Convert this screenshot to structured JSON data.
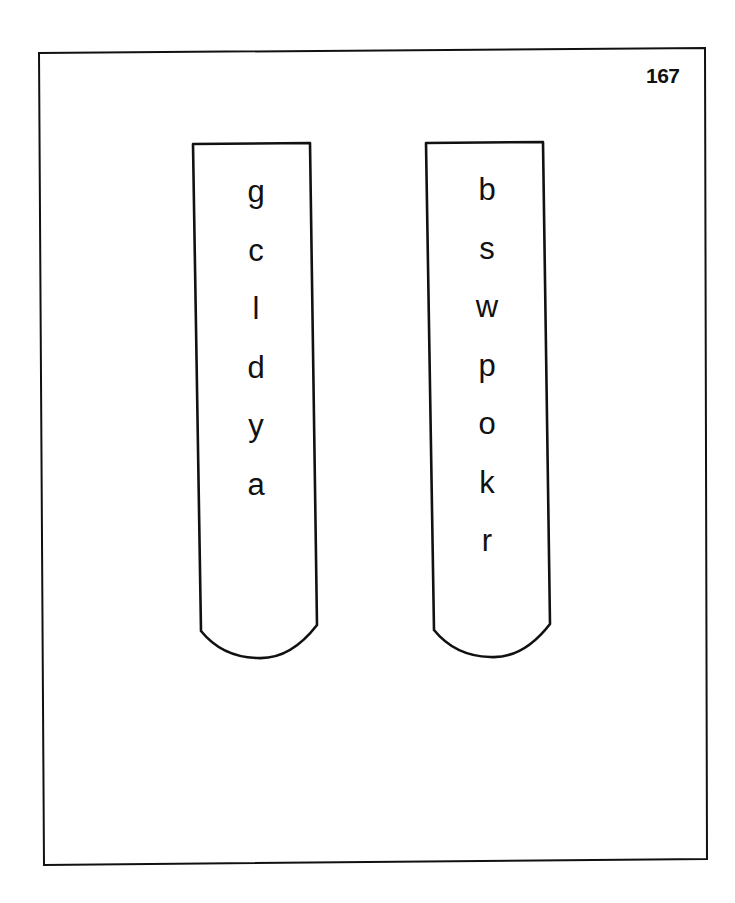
{
  "page": {
    "number": "167"
  },
  "tubes": {
    "left": {
      "letters": [
        "g",
        "c",
        "l",
        "d",
        "y",
        "a"
      ]
    },
    "right": {
      "letters": [
        "b",
        "s",
        "w",
        "p",
        "o",
        "k",
        "r"
      ]
    }
  },
  "colors": {
    "stroke": "#111111",
    "background": "#ffffff"
  }
}
